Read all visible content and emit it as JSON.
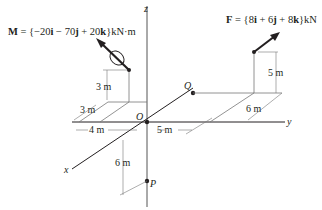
{
  "diagram": {
    "type": "3d-statics-figure",
    "colors": {
      "line": "#231f20",
      "thin": "#555555",
      "background": "#ffffff"
    },
    "axes": {
      "x": "x",
      "y": "y",
      "z": "z"
    },
    "points": {
      "origin": "O",
      "P": "P",
      "Q": "Q"
    },
    "moment": {
      "label": "M",
      "equation_prefix": "M = {",
      "i_coef": "−20",
      "j_coef": " − 70",
      "k_coef": " + 20",
      "unit": "}kN·m"
    },
    "force": {
      "label": "F",
      "equation_prefix": "F = {",
      "i_coef": "8",
      "j_coef": " + 6",
      "k_coef": " + 8",
      "unit": "}kN"
    },
    "unit_vectors": {
      "i": "i",
      "j": "j",
      "k": "k"
    },
    "dimensions": {
      "moment_height": "3 m",
      "moment_x": "3 m",
      "moment_y": "4 m",
      "force_height": "5 m",
      "force_x": "6 m",
      "force_y": "5 m",
      "p_depth": "6 m"
    }
  }
}
